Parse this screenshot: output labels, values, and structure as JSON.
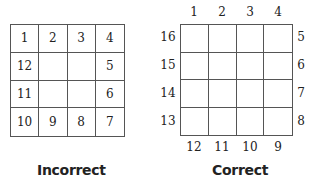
{
  "incorrect": {
    "caption": "Incorrect",
    "cells": [
      "1",
      "2",
      "3",
      "4",
      "12",
      "",
      "",
      "5",
      "11",
      "",
      "",
      "6",
      "10",
      "9",
      "8",
      "7"
    ]
  },
  "correct": {
    "caption": "Correct",
    "top": [
      "1",
      "2",
      "3",
      "4"
    ],
    "right": [
      "5",
      "6",
      "7",
      "8"
    ],
    "bottom": [
      "12",
      "11",
      "10",
      "9"
    ],
    "left": [
      "16",
      "15",
      "14",
      "13"
    ]
  }
}
